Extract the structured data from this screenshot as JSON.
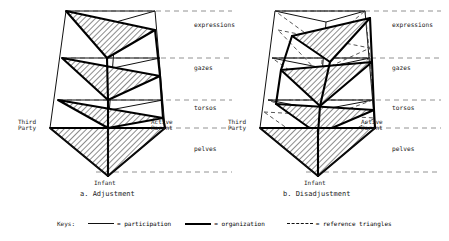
{
  "figure": {
    "row_labels": [
      "expressions",
      "gazes",
      "torsos",
      "pelves"
    ],
    "vertex_labels": {
      "third_party": "Third\nParty",
      "active_parent": "Active\nParent",
      "infant": "Infant"
    },
    "panels": [
      {
        "id": "a",
        "caption": "a. Adjustment"
      },
      {
        "id": "b",
        "caption": "b. Disadjustment"
      }
    ],
    "keys": {
      "title": "Keys:",
      "items": [
        {
          "style": "thin",
          "label": "= participation"
        },
        {
          "style": "thick",
          "label": "= organization"
        },
        {
          "style": "dash",
          "label": "= reference triangles"
        }
      ]
    },
    "colors": {
      "ink": "#111111",
      "background": "#ffffff",
      "hatch": "#000000",
      "dashed": "#555555"
    }
  }
}
